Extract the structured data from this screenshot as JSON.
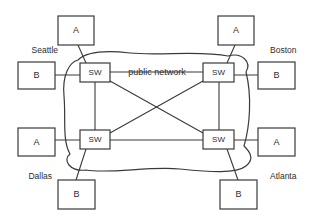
{
  "diagram": {
    "cloud_label": "public network",
    "line_color": "#3a3a3a",
    "background_color": "#ffffff",
    "switch_label": "SW",
    "sites": [
      {
        "id": "seattle",
        "city": "Seattle",
        "city_x": 58,
        "city_y": 51,
        "city_anchor": "end",
        "switch": {
          "label": "SW",
          "x": 80,
          "y": 63,
          "w": 30,
          "h": 19
        },
        "hosts": [
          {
            "label": "A",
            "x": 58,
            "y": 16,
            "w": 36,
            "h": 29
          },
          {
            "label": "B",
            "x": 18,
            "y": 62,
            "w": 37,
            "h": 27
          }
        ]
      },
      {
        "id": "boston",
        "city": "Boston",
        "city_x": 270,
        "city_y": 51,
        "city_anchor": "start",
        "switch": {
          "label": "SW",
          "x": 203,
          "y": 63,
          "w": 31,
          "h": 19
        },
        "hosts": [
          {
            "label": "A",
            "x": 218,
            "y": 16,
            "w": 36,
            "h": 29
          },
          {
            "label": "B",
            "x": 258,
            "y": 62,
            "w": 37,
            "h": 27
          }
        ]
      },
      {
        "id": "dallas",
        "city": "Dallas",
        "city_x": 52,
        "city_y": 177,
        "city_anchor": "end",
        "switch": {
          "label": "SW",
          "x": 80,
          "y": 130,
          "w": 30,
          "h": 19
        },
        "hosts": [
          {
            "label": "A",
            "x": 18,
            "y": 128,
            "w": 37,
            "h": 28
          },
          {
            "label": "B",
            "x": 58,
            "y": 180,
            "w": 37,
            "h": 29
          }
        ]
      },
      {
        "id": "atlanta",
        "city": "Atlanta",
        "city_x": 270,
        "city_y": 177,
        "city_anchor": "start",
        "switch": {
          "label": "SW",
          "x": 203,
          "y": 130,
          "w": 31,
          "h": 19
        },
        "hosts": [
          {
            "label": "A",
            "x": 258,
            "y": 128,
            "w": 37,
            "h": 28
          },
          {
            "label": "B",
            "x": 220,
            "y": 180,
            "w": 37,
            "h": 29
          }
        ]
      }
    ],
    "links": [
      {
        "name": "seattle-sw-to-boston-sw",
        "x1": 110,
        "y1": 72,
        "x2": 203,
        "y2": 72
      },
      {
        "name": "dallas-sw-to-atlanta-sw",
        "x1": 110,
        "y1": 140,
        "x2": 203,
        "y2": 140
      },
      {
        "name": "seattle-sw-to-dallas-sw",
        "x1": 95,
        "y1": 82,
        "x2": 95,
        "y2": 130
      },
      {
        "name": "boston-sw-to-atlanta-sw",
        "x1": 219,
        "y1": 82,
        "x2": 219,
        "y2": 130
      },
      {
        "name": "seattle-sw-to-atlanta-sw",
        "x1": 110,
        "y1": 81,
        "x2": 203,
        "y2": 133
      },
      {
        "name": "boston-sw-to-dallas-sw",
        "x1": 203,
        "y1": 81,
        "x2": 110,
        "y2": 133
      }
    ],
    "access_links": [
      {
        "name": "seattle-host-a-link",
        "x1": 78,
        "y1": 45,
        "x2": 86,
        "y2": 63
      },
      {
        "name": "seattle-host-b-link",
        "x1": 55,
        "y1": 75,
        "x2": 80,
        "y2": 75
      },
      {
        "name": "boston-host-a-link",
        "x1": 235,
        "y1": 45,
        "x2": 227,
        "y2": 63
      },
      {
        "name": "boston-host-b-link",
        "x1": 234,
        "y1": 75,
        "x2": 258,
        "y2": 75
      },
      {
        "name": "dallas-host-a-link",
        "x1": 55,
        "y1": 140,
        "x2": 80,
        "y2": 140
      },
      {
        "name": "dallas-host-b-link",
        "x1": 86,
        "y1": 149,
        "x2": 76,
        "y2": 180
      },
      {
        "name": "atlanta-host-a-link",
        "x1": 234,
        "y1": 140,
        "x2": 258,
        "y2": 140
      },
      {
        "name": "atlanta-host-b-link",
        "x1": 227,
        "y1": 149,
        "x2": 238,
        "y2": 180
      }
    ],
    "cloud": {
      "name": "public-network-cloud",
      "label_x": 157,
      "label_y": 73,
      "path": "M 78 60 C 70 62 62 74 64 96 C 66 118 62 140 70 154 C 62 160 70 172 86 170 C 110 174 150 166 180 169 C 210 172 236 174 246 166 C 256 158 248 150 244 146 C 250 126 252 96 246 72 C 252 62 242 52 228 56 C 200 50 160 56 130 53 C 104 50 86 52 78 60 Z"
    }
  }
}
